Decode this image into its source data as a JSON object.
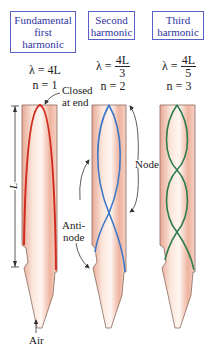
{
  "harmonics": [
    {
      "title_lines": [
        "Fundamental",
        "first",
        "harmonic"
      ],
      "lambda": "λ = 4L",
      "n": "n = 1",
      "wave_color": "#d12b1f"
    },
    {
      "title_lines": [
        "Second",
        "harmonic"
      ],
      "lambda_prefix": "λ = ",
      "lambda_num": "4L",
      "lambda_den": "3",
      "n": "n = 2",
      "wave_color": "#3c78c8"
    },
    {
      "title_lines": [
        "Third",
        "harmonic"
      ],
      "lambda_prefix": "λ = ",
      "lambda_num": "4L",
      "lambda_den": "5",
      "n": "n = 3",
      "wave_color": "#2e7d4f"
    }
  ],
  "annotations": {
    "closed_at_end": [
      "Closed",
      "at end"
    ],
    "node": "Node",
    "antinode": [
      "Anti-",
      "node"
    ],
    "length": "L",
    "air": "Air"
  },
  "colors": {
    "box_border": "#5a5fc8",
    "box_text": "#2f34a0",
    "pipe_fill": "#f3c9b8",
    "pipe_outline": "#8a6b60"
  }
}
